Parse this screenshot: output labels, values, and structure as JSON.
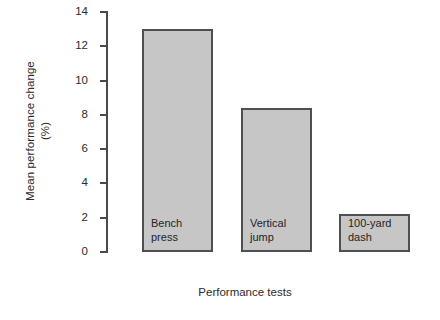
{
  "chart_data": {
    "type": "bar",
    "title": "",
    "xlabel": "Performance tests",
    "ylabel_line1": "Mean performance change",
    "ylabel_line2": "(%)",
    "ylabel": "Mean performance change (%)",
    "categories": [
      "Bench press",
      "Vertical jump",
      "100-yard dash"
    ],
    "category_lines": [
      [
        "Bench",
        "press"
      ],
      [
        "Vertical",
        "jump"
      ],
      [
        "100-yard",
        "dash"
      ]
    ],
    "values": [
      13.0,
      8.4,
      2.2
    ],
    "ylim": [
      0,
      14
    ],
    "yticks": [
      0,
      2,
      4,
      6,
      8,
      10,
      12,
      14
    ],
    "ytick_labels": [
      "0",
      "2",
      "4",
      "6",
      "8",
      "10",
      "12",
      "14"
    ],
    "grid": false,
    "legend": false,
    "legend_position": "none",
    "bar_fill_color": "#c6c6c6",
    "bar_edge_color": "#4f4f4f",
    "axis_color": "#4a4a4a",
    "background_color": "#ffffff",
    "label_placement": "inside-bottom-left"
  }
}
